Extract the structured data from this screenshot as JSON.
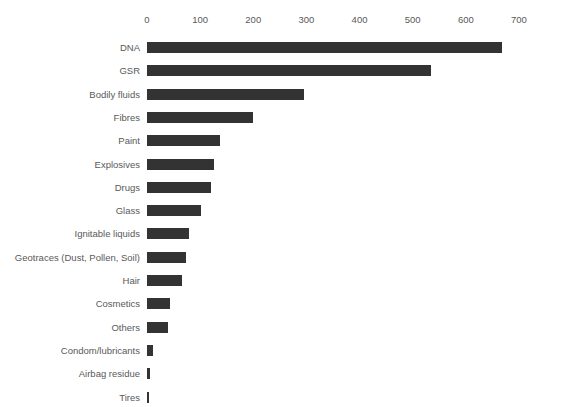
{
  "chart_data": {
    "type": "bar",
    "orientation": "horizontal",
    "title": "",
    "subtitle": "",
    "xlabel": "",
    "ylabel": "",
    "xlim": [
      0,
      700
    ],
    "x_ticks": [
      0,
      100,
      200,
      300,
      400,
      500,
      600,
      700
    ],
    "x_tick_labels": [
      "0",
      "100",
      "200",
      "300",
      "400",
      "500",
      "600",
      "700"
    ],
    "x_axis_position": "top",
    "grid": false,
    "legend": false,
    "legend_position": "none",
    "bar_color": "#333333",
    "label_color": "#595959",
    "background_color": "#ffffff",
    "categories": [
      "DNA",
      "GSR",
      "Bodily fluids",
      "Fibres",
      "Paint",
      "Explosives",
      "Drugs",
      "Glass",
      "Ignitable liquids",
      "Geotraces (Dust, Pollen, Soil)",
      "Hair",
      "Cosmetics",
      "Others",
      "Condom/lubricants",
      "Airbag residue",
      "Tires"
    ],
    "values": [
      668,
      534,
      295,
      200,
      137,
      126,
      120,
      102,
      79,
      73,
      66,
      44,
      40,
      11,
      5,
      3
    ],
    "series": [
      {
        "name": "Count",
        "values": [
          668,
          534,
          295,
          200,
          137,
          126,
          120,
          102,
          79,
          73,
          66,
          44,
          40,
          11,
          5,
          3
        ]
      }
    ]
  },
  "layout": {
    "plot_origin_x": 147,
    "plot_right_x": 520,
    "px_per_unit": 0.5314,
    "first_row_top": 36,
    "row_pitch": 23.3
  }
}
